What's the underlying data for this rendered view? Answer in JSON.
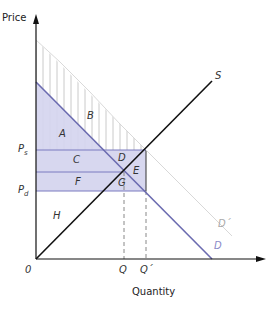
{
  "axes": {
    "y_label": "Price",
    "x_label": "Quantity",
    "origin": "0"
  },
  "curves": {
    "supply": "S",
    "demand": "D",
    "demand_shifted": "D´"
  },
  "prices": {
    "ps": "P",
    "ps_sub": "s",
    "pd": "P",
    "pd_sub": "d"
  },
  "quantities": {
    "q": "Q",
    "q_prime": "Q´"
  },
  "regions": {
    "a": "A",
    "b": "B",
    "c": "C",
    "d": "D",
    "e": "E",
    "f": "F",
    "g": "G",
    "h": "H"
  },
  "colors": {
    "shade": "#c9c9ea",
    "demand": "#6b6bb0",
    "supply": "#111111",
    "hatch": "#bbbbbb"
  }
}
